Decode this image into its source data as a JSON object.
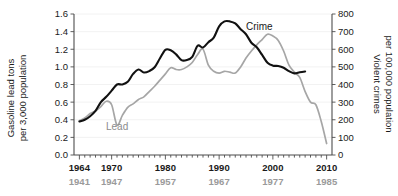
{
  "chart_data": {
    "type": "line",
    "title": "",
    "xlabel": "",
    "ylabel": "Gasoline lead tons\nper 3,000 population",
    "y2label": "Violent crimes\nper 100,000 population",
    "grid": true,
    "legend_position": "inline-annotations",
    "x_axis": {
      "primary_label_color": "#1a1a1a",
      "secondary_label_color": "#9a9a9a",
      "primary_ticks": [
        1964,
        1970,
        1980,
        1990,
        2000,
        2010
      ],
      "secondary_ticks": [
        1941,
        1947,
        1957,
        1967,
        1977,
        1985
      ],
      "xlim": [
        1963,
        2011
      ],
      "offset_years": 23,
      "minor_tick_interval": 1
    },
    "y_left": {
      "label": "Gasoline lead tons per 3,000 population",
      "ticks": [
        0.0,
        0.2,
        0.4,
        0.6,
        0.8,
        1.0,
        1.2,
        1.4,
        1.6
      ],
      "tick_labels": [
        "0.0",
        "0.2",
        "0.4",
        "0.6",
        "0.8",
        "1.0",
        "1.2",
        "1.4",
        "1.6"
      ],
      "ylim": [
        0.0,
        1.6
      ]
    },
    "y_right": {
      "label": "Violent crimes per 100,000 population",
      "ticks": [
        0,
        100,
        200,
        300,
        400,
        500,
        600,
        700,
        800
      ],
      "tick_labels": [
        "0",
        "100",
        "200",
        "300",
        "400",
        "500",
        "600",
        "700",
        "800"
      ],
      "ylim": [
        0,
        800
      ]
    },
    "series": [
      {
        "name": "Crime",
        "axis": "right",
        "color": "#111111",
        "label_text": "Crime",
        "units": "violent crimes per 100,000 population",
        "x": [
          1964,
          1965,
          1966,
          1967,
          1968,
          1969,
          1970,
          1971,
          1972,
          1973,
          1974,
          1975,
          1976,
          1977,
          1978,
          1979,
          1980,
          1981,
          1982,
          1983,
          1984,
          1985,
          1986,
          1987,
          1988,
          1989,
          1990,
          1991,
          1992,
          1993,
          1994,
          1995,
          1996,
          1997,
          1998,
          1999,
          2000,
          2001,
          2002,
          2003,
          2004,
          2005,
          2006
        ],
        "values": [
          190,
          200,
          220,
          250,
          300,
          330,
          365,
          400,
          400,
          415,
          460,
          485,
          468,
          476,
          498,
          549,
          597,
          594,
          571,
          538,
          539,
          557,
          620,
          610,
          640,
          666,
          730,
          758,
          758,
          747,
          714,
          685,
          637,
          611,
          568,
          523,
          507,
          505,
          495,
          476,
          463,
          469,
          474
        ]
      },
      {
        "name": "Lead",
        "axis": "left",
        "color": "#a6a6a6",
        "label_text": "Lead",
        "units": "gasoline lead tons per 3,000 population",
        "x_crime_scale": [
          1964,
          1965,
          1966,
          1967,
          1968,
          1969,
          1970,
          1971,
          1972,
          1973,
          1974,
          1975,
          1976,
          1977,
          1978,
          1979,
          1980,
          1981,
          1982,
          1983,
          1984,
          1985,
          1986,
          1987,
          1988,
          1989,
          1990,
          1991,
          1992,
          1993,
          1994,
          1995,
          1996,
          1997,
          1998,
          1999,
          2000,
          2001,
          2002,
          2003,
          2004,
          2005,
          2006,
          2007,
          2008,
          2009,
          2010
        ],
        "x_lead_years": [
          1941,
          1942,
          1943,
          1944,
          1945,
          1946,
          1947,
          1948,
          1949,
          1950,
          1951,
          1952,
          1953,
          1954,
          1955,
          1956,
          1957,
          1958,
          1959,
          1960,
          1961,
          1962,
          1963,
          1964,
          1965,
          1966,
          1967,
          1968,
          1969,
          1970,
          1971,
          1972,
          1973,
          1974,
          1975,
          1976,
          1977,
          1978,
          1979,
          1980,
          1981,
          1982,
          1983,
          1984,
          1985,
          1986,
          1987
        ],
        "values": [
          0.39,
          0.42,
          0.47,
          0.5,
          0.55,
          0.61,
          0.57,
          0.34,
          0.45,
          0.54,
          0.58,
          0.63,
          0.66,
          0.72,
          0.78,
          0.85,
          0.92,
          0.99,
          0.97,
          0.97,
          1.0,
          1.05,
          1.14,
          1.2,
          1.02,
          0.95,
          0.93,
          0.95,
          0.94,
          0.93,
          1.0,
          1.1,
          1.18,
          1.25,
          1.31,
          1.37,
          1.35,
          1.3,
          1.18,
          1.02,
          0.94,
          0.88,
          0.72,
          0.6,
          0.57,
          0.38,
          0.13
        ]
      }
    ],
    "annotations": [
      {
        "text": "Crime",
        "x_px": 246,
        "y_px": 26,
        "color": "#1a1a1a"
      },
      {
        "text": "Lead",
        "x_px": 106,
        "y_px": 126,
        "color": "#8c8c8c"
      }
    ]
  }
}
